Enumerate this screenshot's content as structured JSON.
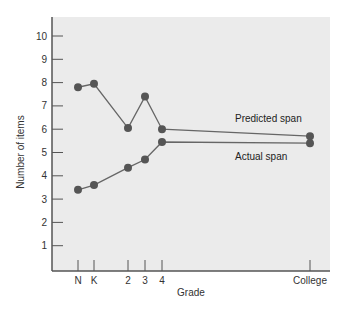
{
  "chart_data": {
    "type": "line",
    "title": "",
    "xlabel": "Grade",
    "ylabel": "Number of items",
    "categories": [
      "N",
      "K",
      "2",
      "3",
      "4",
      "College"
    ],
    "ylim": [
      0,
      10.5
    ],
    "yticks": [
      1,
      2,
      3,
      4,
      5,
      6,
      7,
      8,
      9,
      10
    ],
    "grid": false,
    "legend": "inline labels",
    "series": [
      {
        "name": "Predicted span",
        "values": [
          7.8,
          7.95,
          6.05,
          7.4,
          6.0,
          5.7
        ]
      },
      {
        "name": "Actual span",
        "values": [
          3.4,
          3.6,
          4.35,
          4.7,
          5.45,
          5.4
        ]
      }
    ],
    "colors": {
      "plot_background": "#ebebeb",
      "line": "#666666",
      "marker": "#555555",
      "axis": "#555555"
    }
  }
}
